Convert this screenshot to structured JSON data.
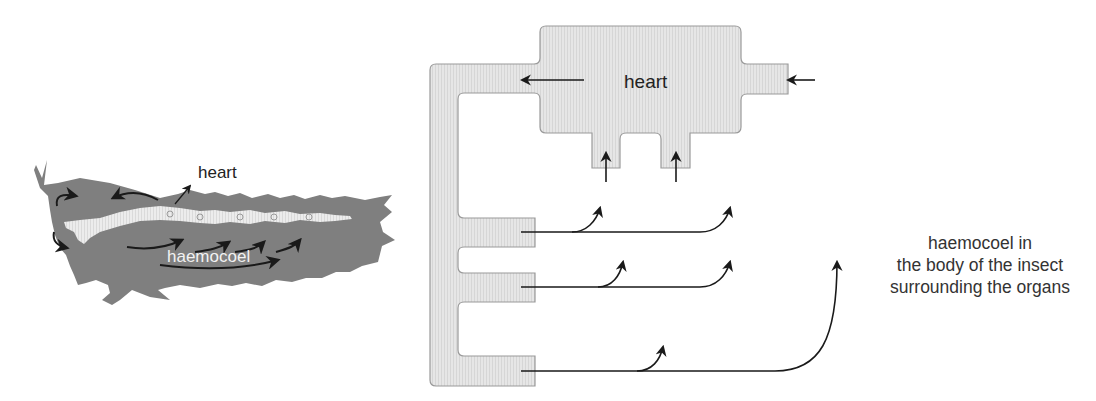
{
  "colors": {
    "insect_body": "#7f7f7f",
    "insect_heart": "#e9e9e9",
    "vessel_fill": "#e4e4e4",
    "vessel_stroke": "#9a9a9a",
    "arrow": "#1a1a1a",
    "text": "#222222"
  },
  "insect": {
    "heart_label": "heart",
    "haemocoel_label": "haemocoel"
  },
  "schematic": {
    "heart_label": "heart",
    "caption_lines": [
      "haemocoel in",
      "the body of the insect",
      "surrounding the organs"
    ]
  }
}
